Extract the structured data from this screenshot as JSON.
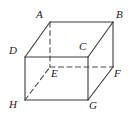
{
  "figure": {
    "name": "cuboid-diagram",
    "type": "geometric-solid",
    "shape": "rectangular-prism",
    "stroke_color": "#3a3a3a",
    "dashed_stroke_color": "#4a4a4a",
    "background_color": "#ffffff",
    "label_color": "#1a1a1a"
  },
  "vertices": [
    {
      "id": "A",
      "label": "A",
      "x": 50,
      "y": 22,
      "label_x": 36,
      "label_y": 9,
      "hidden": false
    },
    {
      "id": "B",
      "label": "B",
      "x": 113,
      "y": 22,
      "label_x": 116,
      "label_y": 9,
      "hidden": false
    },
    {
      "id": "C",
      "label": "C",
      "x": 88,
      "y": 57,
      "label_x": 79,
      "label_y": 41,
      "hidden": false
    },
    {
      "id": "D",
      "label": "D",
      "x": 25,
      "y": 57,
      "label_x": 9,
      "label_y": 45,
      "hidden": false
    },
    {
      "id": "E",
      "label": "E",
      "x": 50,
      "y": 67,
      "label_x": 51,
      "label_y": 68,
      "hidden": true
    },
    {
      "id": "F",
      "label": "F",
      "x": 113,
      "y": 67,
      "label_x": 114,
      "label_y": 68,
      "hidden": false
    },
    {
      "id": "G",
      "label": "G",
      "x": 88,
      "y": 100,
      "label_x": 89,
      "label_y": 100,
      "hidden": false
    },
    {
      "id": "H",
      "label": "H",
      "x": 25,
      "y": 100,
      "label_x": 9,
      "label_y": 99,
      "hidden": false
    }
  ],
  "edges": [
    {
      "id": "AB",
      "from": "A",
      "to": "B",
      "style": "solid",
      "label": "edge-a-b"
    },
    {
      "id": "AD",
      "from": "A",
      "to": "D",
      "style": "solid",
      "label": "edge-a-d"
    },
    {
      "id": "BC",
      "from": "B",
      "to": "C",
      "style": "solid",
      "label": "edge-b-c"
    },
    {
      "id": "DC",
      "from": "D",
      "to": "C",
      "style": "solid",
      "label": "edge-d-c"
    },
    {
      "id": "BF",
      "from": "B",
      "to": "F",
      "style": "solid",
      "label": "edge-b-f"
    },
    {
      "id": "DH",
      "from": "D",
      "to": "H",
      "style": "solid",
      "label": "edge-d-h"
    },
    {
      "id": "CG",
      "from": "C",
      "to": "G",
      "style": "solid",
      "label": "edge-c-g"
    },
    {
      "id": "HG",
      "from": "H",
      "to": "G",
      "style": "solid",
      "label": "edge-h-g"
    },
    {
      "id": "GF",
      "from": "G",
      "to": "F",
      "style": "solid",
      "label": "edge-g-f"
    },
    {
      "id": "AE",
      "from": "A",
      "to": "E",
      "style": "dashed",
      "label": "edge-a-e-hidden"
    },
    {
      "id": "EF",
      "from": "E",
      "to": "F",
      "style": "dashed",
      "label": "edge-e-f-hidden"
    },
    {
      "id": "HE",
      "from": "H",
      "to": "E",
      "style": "dashed",
      "label": "edge-h-e-hidden"
    }
  ],
  "style": {
    "stroke_width": 1.1,
    "dash_pattern": "5,3.5",
    "label_font_size": 11
  }
}
